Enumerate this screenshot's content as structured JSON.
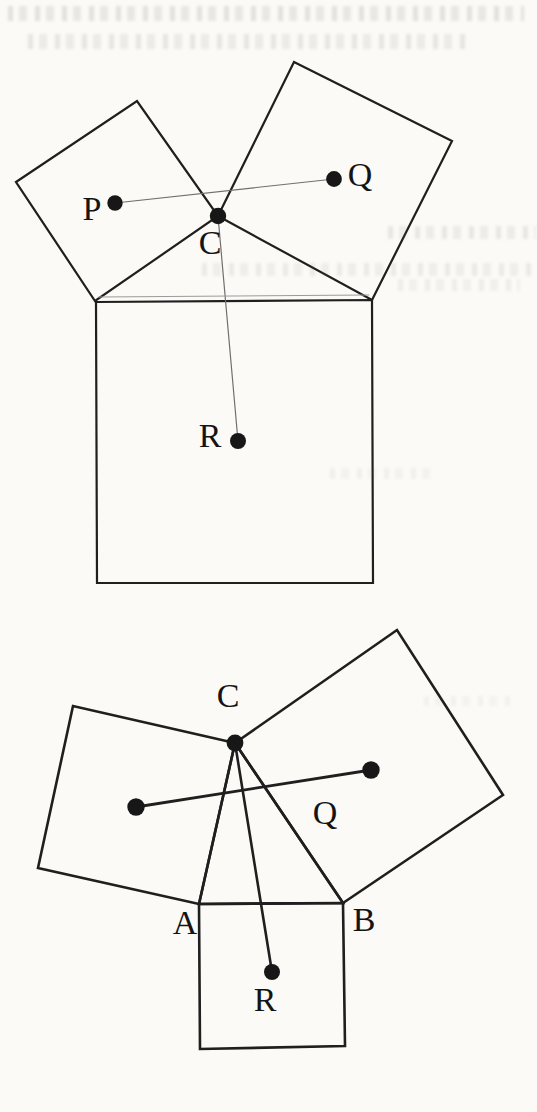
{
  "page": {
    "background": "#fbfaf6",
    "ink": "#1f1f1f",
    "dot_color": "#171717",
    "label_color": "#141414",
    "thin_line_color": "#6f6f6f",
    "label_font_size": 34,
    "width": 537,
    "height": 1112
  },
  "figures": [
    {
      "id": "top-figure",
      "description": "Triangle with a square drawn on each side; dots P, Q, R at square centres, C at apex",
      "polygons": [
        {
          "name": "hypotenuse-square",
          "points": "96,302 372,300 373,583 97,583",
          "stroke_width": 2.2
        },
        {
          "name": "left-leg-square",
          "points": "16,182 137,101 218,216 95,301",
          "stroke_width": 2.2
        },
        {
          "name": "right-leg-square",
          "points": "218,216 294,62 452,141 372,300",
          "stroke_width": 2.2
        }
      ],
      "segments": [
        {
          "name": "segment-P-Q",
          "x1": 115,
          "y1": 203,
          "x2": 334,
          "y2": 179,
          "stroke_width": 1.2,
          "color": "#6f6f6f"
        },
        {
          "name": "segment-C-R",
          "x1": 218,
          "y1": 216,
          "x2": 238,
          "y2": 441,
          "stroke_width": 1.2,
          "color": "#6f6f6f"
        },
        {
          "name": "triangle-base-scan-double-line",
          "x1": 99,
          "y1": 297,
          "x2": 369,
          "y2": 295,
          "stroke_width": 1,
          "color": "#9a9a9a"
        }
      ],
      "dots": [
        {
          "name": "point-P",
          "x": 115,
          "y": 203,
          "r": 7.7
        },
        {
          "name": "point-Q",
          "x": 334,
          "y": 179,
          "r": 7.9
        },
        {
          "name": "point-C",
          "x": 218,
          "y": 216,
          "r": 8.2
        },
        {
          "name": "point-R",
          "x": 238,
          "y": 441,
          "r": 8.0
        }
      ],
      "labels": [
        {
          "name": "label-P",
          "text": "P",
          "x": 92,
          "y": 208
        },
        {
          "name": "label-Q",
          "text": "Q",
          "x": 360,
          "y": 174
        },
        {
          "name": "label-C",
          "text": "C",
          "x": 210,
          "y": 242
        },
        {
          "name": "label-R",
          "text": "R",
          "x": 210,
          "y": 435
        }
      ]
    },
    {
      "id": "bottom-figure",
      "description": "Tilted triangle ABC with squares on all three sides; centre dots, Q and R labelled, cevians from C",
      "polygons": [
        {
          "name": "left-leg-square",
          "points": "235,743 73,706 38,868 199,904",
          "stroke_width": 2.6
        },
        {
          "name": "right-leg-square",
          "points": "235,743 397,630 503,795 343,903",
          "stroke_width": 2.6
        },
        {
          "name": "base-square",
          "points": "199,904 343,903 345,1046 200,1049",
          "stroke_width": 2.6
        },
        {
          "name": "triangle-A-B-C",
          "points": "199,904 235,743 343,903",
          "stroke_width": 2.6
        }
      ],
      "segments": [
        {
          "name": "segment-C-R",
          "x1": 235,
          "y1": 743,
          "x2": 272,
          "y2": 972,
          "stroke_width": 2.6,
          "color": "#1f1f1f"
        },
        {
          "name": "segment-P-Q",
          "x1": 136,
          "y1": 807,
          "x2": 371,
          "y2": 770,
          "stroke_width": 2.8,
          "color": "#1f1f1f"
        }
      ],
      "dots": [
        {
          "name": "point-C",
          "x": 235,
          "y": 743,
          "r": 8.4
        },
        {
          "name": "point-left-square-center",
          "x": 136,
          "y": 807,
          "r": 8.7
        },
        {
          "name": "point-Q",
          "x": 371,
          "y": 770,
          "r": 8.7
        },
        {
          "name": "point-R",
          "x": 272,
          "y": 972,
          "r": 8.0
        }
      ],
      "labels": [
        {
          "name": "label-C",
          "text": "C",
          "x": 228,
          "y": 695
        },
        {
          "name": "label-Q",
          "text": "Q",
          "x": 325,
          "y": 812
        },
        {
          "name": "label-A",
          "text": "A",
          "x": 185,
          "y": 922
        },
        {
          "name": "label-B",
          "text": "B",
          "x": 364,
          "y": 919
        },
        {
          "name": "label-R",
          "text": "R",
          "x": 265,
          "y": 999
        }
      ]
    }
  ],
  "bleedthrough_marks": [
    {
      "name": "bleedthrough-line-1",
      "x": 8,
      "y": 6,
      "w": 516,
      "h": 15,
      "opacity": 0.33
    },
    {
      "name": "bleedthrough-line-2",
      "x": 28,
      "y": 34,
      "w": 442,
      "h": 15,
      "opacity": 0.28
    },
    {
      "name": "bleedthrough-line-3",
      "x": 388,
      "y": 226,
      "w": 148,
      "h": 13,
      "opacity": 0.26
    },
    {
      "name": "bleedthrough-line-4",
      "x": 202,
      "y": 263,
      "w": 332,
      "h": 13,
      "opacity": 0.22
    },
    {
      "name": "bleedthrough-line-5",
      "x": 398,
      "y": 279,
      "w": 122,
      "h": 12,
      "opacity": 0.18
    },
    {
      "name": "bleedthrough-line-6",
      "x": 330,
      "y": 468,
      "w": 104,
      "h": 11,
      "opacity": 0.14
    },
    {
      "name": "bleedthrough-line-7",
      "x": 424,
      "y": 696,
      "w": 92,
      "h": 10,
      "opacity": 0.12
    }
  ]
}
